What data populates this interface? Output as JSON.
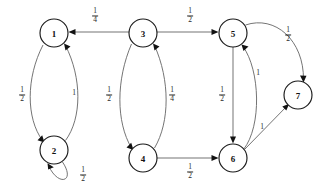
{
  "diagram": {
    "type": "directed-graph",
    "colors": {
      "background": "#ffffff",
      "node_stroke": "#1a1a1a",
      "node_fill": "#ffffff",
      "edge_stroke": "#6d6d6d",
      "arrow_fill": "#121212",
      "label_color": "#2a2a2a"
    },
    "nodes": [
      {
        "id": "1",
        "label": "1",
        "cx": 54,
        "cy": 33,
        "r": 14
      },
      {
        "id": "2",
        "label": "2",
        "cx": 54,
        "cy": 150,
        "r": 14
      },
      {
        "id": "3",
        "label": "3",
        "cx": 143,
        "cy": 33,
        "r": 14
      },
      {
        "id": "4",
        "label": "4",
        "cx": 143,
        "cy": 158,
        "r": 14
      },
      {
        "id": "5",
        "label": "5",
        "cx": 233,
        "cy": 33,
        "r": 14
      },
      {
        "id": "6",
        "label": "6",
        "cx": 233,
        "cy": 158,
        "r": 14
      },
      {
        "id": "7",
        "label": "7",
        "cx": 298,
        "cy": 95,
        "r": 14
      }
    ],
    "edges": [
      {
        "from": "3",
        "to": "1",
        "weight_num": "1",
        "weight_den": "4",
        "label_x": 95,
        "label_y": 16
      },
      {
        "from": "3",
        "to": "5",
        "weight_num": "1",
        "weight_den": "2",
        "label_x": 190,
        "label_y": 16
      },
      {
        "from": "1",
        "to": "2",
        "weight_num": "1",
        "weight_den": "2",
        "label_x": 22,
        "label_y": 95
      },
      {
        "from": "2",
        "to": "1",
        "weight_num": "1",
        "weight_den": "",
        "label_x": 74,
        "label_y": 93
      },
      {
        "from": "3",
        "to": "4",
        "weight_num": "1",
        "weight_den": "2",
        "label_x": 109,
        "label_y": 95
      },
      {
        "from": "4",
        "to": "3",
        "weight_num": "1",
        "weight_den": "4",
        "label_x": 172,
        "label_y": 95
      },
      {
        "from": "5",
        "to": "6",
        "weight_num": "1",
        "weight_den": "2",
        "label_x": 222,
        "label_y": 95
      },
      {
        "from": "6",
        "to": "5",
        "weight_num": "1",
        "weight_den": "",
        "label_x": 258,
        "label_y": 73
      },
      {
        "from": "5",
        "to": "7",
        "weight_num": "1",
        "weight_den": "2",
        "label_x": 288,
        "label_y": 35
      },
      {
        "from": "6",
        "to": "7",
        "weight_num": "1",
        "weight_den": "",
        "label_x": 262,
        "label_y": 127
      },
      {
        "from": "4",
        "to": "6",
        "weight_num": "1",
        "weight_den": "2",
        "label_x": 190,
        "label_y": 172
      },
      {
        "from": "2",
        "to": "2",
        "weight_num": "1",
        "weight_den": "2",
        "label_x": 83,
        "label_y": 175
      }
    ]
  }
}
